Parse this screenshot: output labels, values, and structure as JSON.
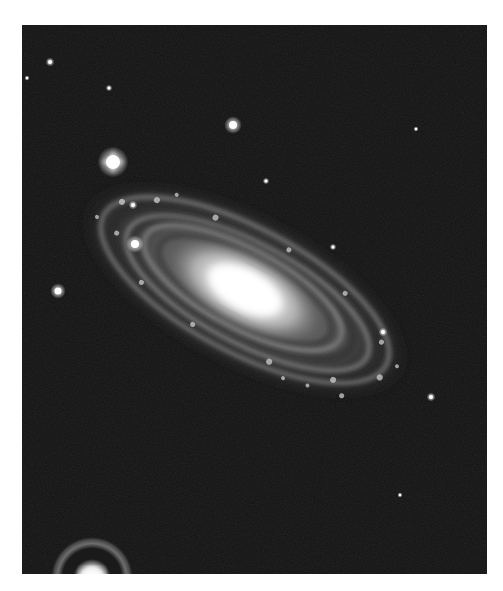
{
  "image": {
    "subject": "spiral galaxy",
    "description": "Black-and-white photograph of an inclined spiral galaxy with bright core and dusty spiral arms, surrounded by foreground stars",
    "background_color": "#111111",
    "page_color": "#ffffff",
    "frame": {
      "x": 22,
      "y": 25,
      "width": 465,
      "height": 549
    }
  },
  "galaxy": {
    "center": [
      245,
      290
    ],
    "tilt_deg": 28,
    "core_color": "#ffffff",
    "disk_color": "#bdbdbd",
    "arm_color": "#8a8a8a"
  },
  "stars": [
    {
      "x": 113,
      "y": 162,
      "r": 7,
      "spikes": true
    },
    {
      "x": 233,
      "y": 125,
      "r": 4
    },
    {
      "x": 58,
      "y": 291,
      "r": 3.5
    },
    {
      "x": 135,
      "y": 244,
      "r": 4
    },
    {
      "x": 133,
      "y": 205,
      "r": 2
    },
    {
      "x": 50,
      "y": 62,
      "r": 2
    },
    {
      "x": 27,
      "y": 78,
      "r": 1.2
    },
    {
      "x": 109,
      "y": 88,
      "r": 1.5
    },
    {
      "x": 266,
      "y": 181,
      "r": 1.5
    },
    {
      "x": 416,
      "y": 129,
      "r": 1.2
    },
    {
      "x": 333,
      "y": 247,
      "r": 1.5
    },
    {
      "x": 383,
      "y": 332,
      "r": 2
    },
    {
      "x": 431,
      "y": 397,
      "r": 2
    },
    {
      "x": 400,
      "y": 495,
      "r": 1.2
    }
  ],
  "halo_star": {
    "x": 92,
    "y": 578,
    "ring_radius": 33
  }
}
